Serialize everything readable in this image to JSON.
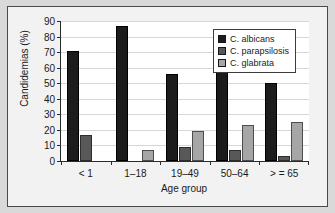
{
  "figure": {
    "frame_border_color": "#4a4a4a",
    "background_color": "#f2f2f2",
    "outer_color": "#d9d9d9"
  },
  "chart_data": {
    "type": "bar",
    "title": "",
    "xlabel": "Age group",
    "ylabel": "Candidemias (%)",
    "categories": [
      "< 1",
      "1–18",
      "19–49",
      "50–64",
      "> = 65"
    ],
    "series": [
      {
        "name": "C. albicans",
        "color": "#1c1c1c",
        "values": [
          71,
          87,
          56,
          59,
          50
        ]
      },
      {
        "name": "C. parapsilosis",
        "color": "#585858",
        "values": [
          17,
          0,
          9,
          7,
          3
        ]
      },
      {
        "name": "C. glabrata",
        "color": "#a6a6a6",
        "values": [
          0,
          7,
          19,
          23,
          25
        ]
      }
    ],
    "ylim": [
      0,
      90
    ],
    "yticks": [
      0,
      10,
      20,
      30,
      40,
      50,
      60,
      70,
      80,
      90
    ],
    "ytick_labels": [
      "0",
      "10",
      "20",
      "30",
      "40",
      "50",
      "60",
      "70",
      "80",
      "90"
    ],
    "grid": true,
    "grid_axis": "y",
    "legend_position": "top-right",
    "legend_entries": [
      "C. albicans",
      "C. parapsilosis",
      "C. glabrata"
    ]
  }
}
